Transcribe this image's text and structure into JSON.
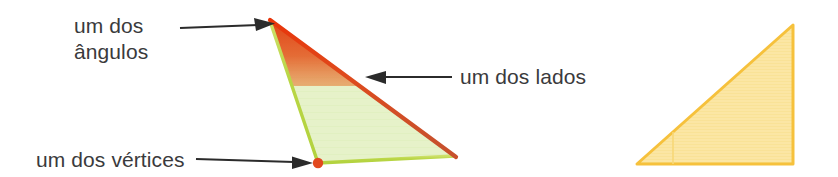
{
  "figure": {
    "kind": "geometry-annotation-diagram",
    "background_color": "#ffffff",
    "labels": {
      "angle_line1": "um dos",
      "angle_line2": "ângulos",
      "side": "um dos lados",
      "vertex": "um dos vértices"
    },
    "colors": {
      "text": "#3a3a3c",
      "arrow": "#2b2b2b",
      "green_fill": "#e6f2c9",
      "green_edge": "#b9d645",
      "red_edge": "#e04a22",
      "red_gradient_top": "#e23c10",
      "vertex_dot": "#e2491f",
      "yellow_fill": "#fbe5a0",
      "yellow_edge": "#f7c846"
    },
    "shapes": [
      {
        "name": "annotated-triangle",
        "type": "triangle",
        "points": "270,20 455,156 318,163",
        "fill": "#e6f2c9",
        "highlighted_angle_vertex": "270,20",
        "highlighted_side": "270,20 to 455,156",
        "highlighted_vertex": "318,163"
      },
      {
        "name": "plain-triangle",
        "type": "triangle",
        "points": "637,164 793,25 793,164",
        "fill": "#fbe5a0",
        "edge": "#f7c846"
      }
    ],
    "arrows": [
      {
        "name": "arrow-to-angle",
        "from": "180,27",
        "to": "270,24",
        "direction": "right"
      },
      {
        "name": "arrow-to-side",
        "from": "452,77",
        "to": "368,77",
        "direction": "left"
      },
      {
        "name": "arrow-to-vertex",
        "from": "228,160",
        "to": "312,163",
        "direction": "right"
      }
    ]
  }
}
